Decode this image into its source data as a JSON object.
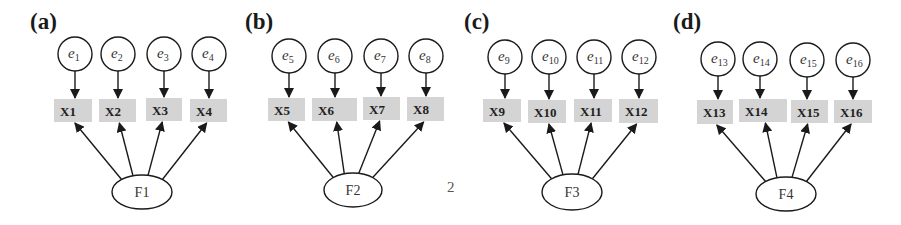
{
  "colors": {
    "background": "#ffffff",
    "stroke": "#1a1a1a",
    "box_fill": "#d4d4d4",
    "node_fill": "#ffffff"
  },
  "panels": [
    {
      "label": "(a)",
      "label_pos": [
        30,
        29
      ],
      "factor": {
        "label": "F1",
        "cx": 142,
        "cy": 192,
        "rx": 30,
        "ry": 17
      },
      "indicators": [
        {
          "label": "X1",
          "box": [
            54,
            99,
            38,
            23
          ],
          "error": {
            "base": "e",
            "sub": "1",
            "cx": 75,
            "cy": 54
          }
        },
        {
          "label": "X2",
          "box": [
            99,
            99,
            37,
            23
          ],
          "error": {
            "base": "e",
            "sub": "2",
            "cx": 118,
            "cy": 54
          }
        },
        {
          "label": "X3",
          "box": [
            146,
            98,
            36,
            23
          ],
          "error": {
            "base": "e",
            "sub": "3",
            "cx": 164,
            "cy": 54
          }
        },
        {
          "label": "X4",
          "box": [
            190,
            99,
            37,
            23
          ],
          "error": {
            "base": "e",
            "sub": "4",
            "cx": 209,
            "cy": 54
          }
        }
      ]
    },
    {
      "label": "(b)",
      "label_pos": [
        245,
        29
      ],
      "factor": {
        "label": "F2",
        "cx": 353,
        "cy": 190,
        "rx": 29,
        "ry": 17
      },
      "indicators": [
        {
          "label": "X5",
          "box": [
            268,
            98,
            37,
            23
          ],
          "error": {
            "base": "e",
            "sub": "5",
            "cx": 289,
            "cy": 56
          }
        },
        {
          "label": "X6",
          "box": [
            312,
            98,
            45,
            23
          ],
          "error": {
            "base": "e",
            "sub": "6",
            "cx": 335,
            "cy": 56
          }
        },
        {
          "label": "X7",
          "box": [
            363,
            97,
            37,
            23
          ],
          "error": {
            "base": "e",
            "sub": "7",
            "cx": 381,
            "cy": 56
          }
        },
        {
          "label": "X8",
          "box": [
            407,
            97,
            37,
            24
          ],
          "error": {
            "base": "e",
            "sub": "8",
            "cx": 426,
            "cy": 56
          }
        }
      ]
    },
    {
      "label": "(c)",
      "label_pos": [
        464,
        29
      ],
      "factor": {
        "label": "F3",
        "cx": 572,
        "cy": 192,
        "rx": 30,
        "ry": 18
      },
      "indicators": [
        {
          "label": "X9",
          "box": [
            483,
            99,
            38,
            23
          ],
          "error": {
            "base": "e",
            "sub": "9",
            "cx": 505,
            "cy": 57
          }
        },
        {
          "label": "X10",
          "box": [
            528,
            100,
            38,
            23
          ],
          "error": {
            "base": "e",
            "sub": "10",
            "cx": 549,
            "cy": 57
          }
        },
        {
          "label": "X11",
          "box": [
            574,
            99,
            38,
            23
          ],
          "error": {
            "base": "e",
            "sub": "11",
            "cx": 594,
            "cy": 57
          }
        },
        {
          "label": "X12",
          "box": [
            619,
            99,
            39,
            24
          ],
          "error": {
            "base": "e",
            "sub": "12",
            "cx": 639,
            "cy": 57
          }
        }
      ]
    },
    {
      "label": "(d)",
      "label_pos": [
        673,
        29
      ],
      "factor": {
        "label": "F4",
        "cx": 786,
        "cy": 194,
        "rx": 30,
        "ry": 17
      },
      "indicators": [
        {
          "label": "X13",
          "box": [
            697,
            100,
            36,
            24
          ],
          "error": {
            "base": "e",
            "sub": "13",
            "cx": 718,
            "cy": 59
          }
        },
        {
          "label": "X14",
          "box": [
            739,
            99,
            48,
            23
          ],
          "error": {
            "base": "e",
            "sub": "14",
            "cx": 760,
            "cy": 59
          }
        },
        {
          "label": "X15",
          "box": [
            791,
            100,
            37,
            23
          ],
          "error": {
            "base": "e",
            "sub": "15",
            "cx": 807,
            "cy": 60
          }
        },
        {
          "label": "X16",
          "box": [
            834,
            100,
            38,
            23
          ],
          "error": {
            "base": "e",
            "sub": "16",
            "cx": 853,
            "cy": 60
          }
        }
      ]
    }
  ],
  "stray_text": {
    "text": "2",
    "x": 447,
    "y": 192
  }
}
